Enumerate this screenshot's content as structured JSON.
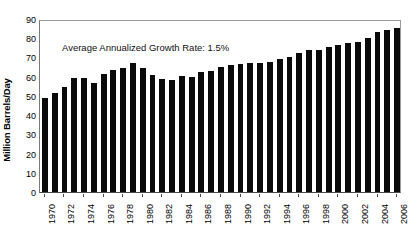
{
  "chart_data": {
    "type": "bar",
    "title": "",
    "subtitle": "",
    "xlabel": "",
    "ylabel": "Million Barrels/Day",
    "ylim": [
      0,
      90
    ],
    "ytick_step": 10,
    "yticks": [
      0,
      10,
      20,
      30,
      40,
      50,
      60,
      70,
      80,
      90
    ],
    "ytick_labels": [
      "0",
      "10",
      "20",
      "30",
      "40",
      "50",
      "60",
      "70",
      "80",
      "90"
    ],
    "grid": false,
    "legend": "none",
    "bar_color": "#0a0a0a",
    "annotations": [
      {
        "name": "growth-rate-note",
        "text": "Average Annualized Growth Rate: 1.5%"
      }
    ],
    "xtick_label_rotation": "vertical",
    "xtick_label_interval": 2,
    "xtick_labels": [
      "1970",
      "1972",
      "1974",
      "1976",
      "1978",
      "1980",
      "1982",
      "1984",
      "1986",
      "1988",
      "1990",
      "1992",
      "1994",
      "1996",
      "1998",
      "2000",
      "2002",
      "2004",
      "2006"
    ],
    "categories": [
      "1970",
      "1971",
      "1972",
      "1973",
      "1974",
      "1975",
      "1976",
      "1977",
      "1978",
      "1979",
      "1980",
      "1981",
      "1982",
      "1983",
      "1984",
      "1985",
      "1986",
      "1987",
      "1988",
      "1989",
      "1990",
      "1991",
      "1992",
      "1993",
      "1994",
      "1995",
      "1996",
      "1997",
      "1998",
      "1999",
      "2000",
      "2001",
      "2002",
      "2003",
      "2004",
      "2005",
      "2006"
    ],
    "values": [
      48.7,
      51.6,
      54.6,
      59.4,
      59.5,
      56.9,
      61.2,
      63.7,
      64.7,
      67.2,
      64.4,
      61.1,
      58.7,
      58.5,
      60.1,
      60.0,
      62.2,
      63.2,
      65.2,
      66.3,
      66.6,
      67.0,
      67.2,
      67.5,
      69.0,
      70.4,
      72.2,
      73.7,
      74.1,
      75.5,
      76.7,
      77.5,
      78.2,
      79.9,
      83.0,
      84.2,
      85.5
    ]
  }
}
